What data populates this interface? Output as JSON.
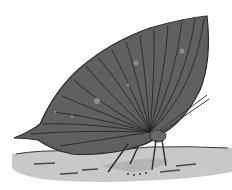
{
  "image": {
    "subject": "leaf butterfly",
    "description": "Grayscale illustration of a leaf-mimicking butterfly with closed wings resting on the ground",
    "style": "grayscale illustration",
    "width": 232,
    "height": 190
  },
  "colors": {
    "background": "#ffffff",
    "wing_fill": "#5f5f5f",
    "wing_dark": "#4a4a4a",
    "vein": "#1e1e1e",
    "ground": "#c8c8c8",
    "ground_shadow": "#b4b4b4",
    "outline": "#2a2a2a",
    "spots": "#9a9a9a"
  }
}
